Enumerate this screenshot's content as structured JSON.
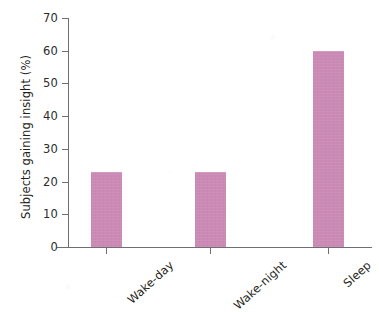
{
  "chart_data": {
    "type": "bar",
    "title": "",
    "xlabel": "",
    "ylabel": "Subjects gaining insight (%)",
    "categories": [
      "Wake-day",
      "Wake-night",
      "Sleep"
    ],
    "values": [
      23,
      23,
      60
    ],
    "series": [
      {
        "name": "Subjects gaining insight",
        "values": [
          23,
          23,
          60
        ]
      }
    ],
    "ylim": [
      0,
      70
    ],
    "yticks": [
      0,
      10,
      20,
      30,
      40,
      50,
      60,
      70
    ],
    "ytick_labels": [
      "0",
      "10",
      "20",
      "30",
      "40",
      "50",
      "60",
      "70"
    ],
    "grid": false,
    "legend": false,
    "legend_position": "none",
    "bar_color": "#cb8ab5",
    "axis_color": "#6f6f73",
    "text_color": "#1f1f22",
    "background_color": "#ffffff",
    "xtick_label_rotation": -42
  },
  "figure": {
    "title_remnant": ""
  }
}
